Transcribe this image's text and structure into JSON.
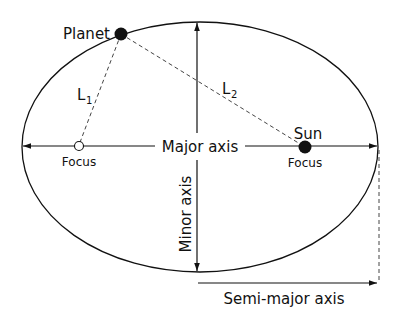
{
  "diagram": {
    "labels": {
      "planet": "Planet",
      "sun": "Sun",
      "focus_left": "Focus",
      "focus_right": "Focus",
      "major_axis": "Major axis",
      "minor_axis": "Minor axis",
      "semi_major_axis": "Semi-major axis",
      "l1": "L",
      "l1_sub": "1",
      "l2": "L",
      "l2_sub": "2"
    },
    "colors": {
      "stroke": "#111111",
      "dashed": "#444444",
      "background": "#ffffff"
    }
  }
}
